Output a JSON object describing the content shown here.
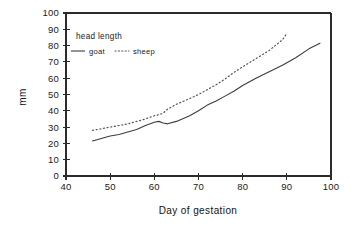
{
  "chart_data": {
    "type": "line",
    "title": "",
    "xlabel": "Day of gestation",
    "ylabel": "mm",
    "xlim": [
      40,
      100
    ],
    "ylim": [
      0,
      100
    ],
    "grid": false,
    "legend_position": "top-left-inside",
    "legend_title": "head length",
    "xticks": [
      40,
      50,
      60,
      70,
      80,
      90,
      100
    ],
    "yticks": [
      0,
      10,
      20,
      30,
      40,
      50,
      60,
      70,
      80,
      90,
      100
    ],
    "xtick_labels": [
      "40",
      "50",
      "60",
      "70",
      "80",
      "90",
      "100"
    ],
    "ytick_labels": [
      "0",
      "10",
      "20",
      "30",
      "40",
      "50",
      "60",
      "70",
      "80",
      "90",
      "100"
    ],
    "series": [
      {
        "name": "goat",
        "style": "solid",
        "color": "#3c3c3c",
        "x": [
          46,
          48,
          50,
          52,
          54,
          56,
          58,
          60,
          61,
          62,
          63,
          65,
          68,
          70,
          72,
          74,
          76,
          78,
          80,
          83,
          86,
          89,
          92,
          95,
          97.5
        ],
        "y": [
          21.5,
          23,
          24.5,
          25.5,
          27,
          28.5,
          31,
          33,
          33.5,
          32.5,
          32,
          33.5,
          37,
          40,
          43.5,
          46,
          49,
          52,
          55.5,
          60,
          64,
          68,
          72.5,
          78,
          81.5
        ]
      },
      {
        "name": "sheep",
        "style": "dotted",
        "color": "#555555",
        "x": [
          46,
          48,
          50,
          52,
          54,
          56,
          58,
          60,
          61,
          62,
          63,
          65,
          68,
          70,
          72,
          74,
          76,
          78,
          80,
          83,
          86,
          89,
          90
        ],
        "y": [
          28,
          29,
          30,
          31,
          32,
          33.5,
          35,
          37,
          37.5,
          38.5,
          41,
          44,
          47.5,
          50,
          53,
          56,
          59.5,
          63.5,
          67,
          72,
          77,
          83.5,
          87.5
        ]
      }
    ]
  },
  "axes": {
    "x_axis_label": "Day of gestation",
    "y_axis_label": "mm"
  },
  "legend": {
    "title": "head length",
    "entries": [
      {
        "label": "goat",
        "style": "solid"
      },
      {
        "label": "sheep",
        "style": "dotted"
      }
    ]
  }
}
